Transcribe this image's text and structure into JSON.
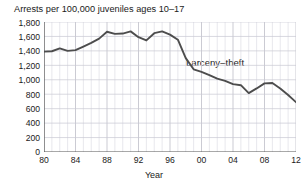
{
  "chart_data": {
    "type": "line",
    "title": "Arrests per 100,000 juveniles ages 10–17",
    "subtitle": "",
    "xlabel": "Year",
    "ylabel": "",
    "xlim": [
      1980,
      2012
    ],
    "ylim": [
      0,
      1800
    ],
    "grid": true,
    "grid_detail": "vertical gridlines every year, horizontal gridlines every 200 units",
    "legend_position": "inline-annotation",
    "annotations": [
      {
        "text": "Larceny–theft",
        "x": 1998,
        "y": 1270
      }
    ],
    "xticks": [
      1980,
      1984,
      1988,
      1992,
      1996,
      2000,
      2004,
      2008,
      2012
    ],
    "xtick_labels": [
      "80",
      "84",
      "88",
      "92",
      "96",
      "00",
      "04",
      "08",
      "12"
    ],
    "yticks": [
      0,
      200,
      400,
      600,
      800,
      1000,
      1200,
      1400,
      1600,
      1800
    ],
    "ytick_labels": [
      "0",
      "200",
      "400",
      "600",
      "800",
      "1,000",
      "1,200",
      "1,400",
      "1,600",
      "1,800"
    ],
    "series": [
      {
        "name": "Larceny–theft",
        "color": "#4d4d4d",
        "x": [
          1980,
          1981,
          1982,
          1983,
          1984,
          1985,
          1986,
          1987,
          1988,
          1989,
          1990,
          1991,
          1992,
          1993,
          1994,
          1995,
          1996,
          1997,
          1998,
          1999,
          2000,
          2001,
          2002,
          2003,
          2004,
          2005,
          2006,
          2007,
          2008,
          2009,
          2010,
          2011,
          2012
        ],
        "values": [
          1390,
          1395,
          1435,
          1400,
          1410,
          1460,
          1510,
          1570,
          1665,
          1635,
          1640,
          1670,
          1590,
          1545,
          1645,
          1670,
          1625,
          1555,
          1300,
          1145,
          1110,
          1065,
          1015,
          985,
          940,
          925,
          815,
          880,
          950,
          955,
          880,
          790,
          690
        ]
      }
    ]
  }
}
